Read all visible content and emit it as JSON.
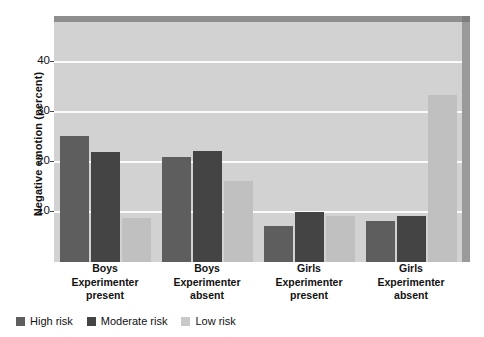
{
  "chart_data": {
    "type": "bar",
    "title": "",
    "xlabel": "",
    "ylabel": "Negative emotion (percent)",
    "ylim": [
      0,
      48
    ],
    "yticks": [
      10,
      20,
      30,
      40
    ],
    "ytick_labels": [
      "10",
      "20",
      "30",
      "40"
    ],
    "grid": true,
    "legend_position": "bottom-left",
    "categories": [
      {
        "name": "Boys",
        "condition_line1": "Experimenter",
        "condition_line2": "present"
      },
      {
        "name": "Boys",
        "condition_line1": "Experimenter",
        "condition_line2": "absent"
      },
      {
        "name": "Girls",
        "condition_line1": "Experimenter",
        "condition_line2": "present"
      },
      {
        "name": "Girls",
        "condition_line1": "Experimenter",
        "condition_line2": "absent"
      }
    ],
    "series": [
      {
        "name": "High risk",
        "color": "#5e5e5e",
        "values": [
          25.2,
          21.0,
          7.2,
          8.2
        ]
      },
      {
        "name": "Moderate risk",
        "color": "#444444",
        "values": [
          22.0,
          22.2,
          10.1,
          9.2
        ]
      },
      {
        "name": "Low risk",
        "color": "#c0c0c0",
        "values": [
          8.8,
          16.2,
          9.2,
          33.5
        ]
      }
    ]
  },
  "axis": {
    "y_title": "Negative emotion (percent)",
    "ticks": [
      {
        "label": "40",
        "value": 40
      },
      {
        "label": "30",
        "value": 30
      },
      {
        "label": "20",
        "value": 20
      },
      {
        "label": "10",
        "value": 10
      }
    ]
  },
  "legend": {
    "items": [
      {
        "label": "High risk",
        "color": "#5e5e5e"
      },
      {
        "label": "Moderate risk",
        "color": "#444444"
      },
      {
        "label": "Low risk",
        "color": "#c9c9c9"
      }
    ]
  }
}
